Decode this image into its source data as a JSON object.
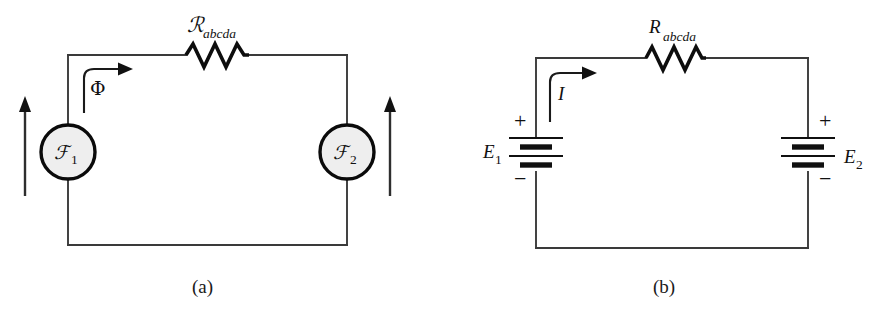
{
  "figure": {
    "background_color": "#ffffff",
    "ink_color": "#111111",
    "source_fill_color": "#eeeeee"
  },
  "panel_a": {
    "caption": "(a)",
    "resistor_label": {
      "symbol": "ℛ",
      "subscript": "abcda",
      "full": "ℛabcda",
      "name": "reluctance"
    },
    "flux_label": {
      "symbol": "Φ",
      "name": "magnetic-flux"
    },
    "source_left": {
      "symbol": "ℱ",
      "subscript": "1",
      "full": "ℱ1",
      "name": "magnetomotive-force-1"
    },
    "source_right": {
      "symbol": "ℱ",
      "subscript": "2",
      "full": "ℱ2",
      "name": "magnetomotive-force-2"
    },
    "arrow_left": "up",
    "arrow_right": "up"
  },
  "panel_b": {
    "caption": "(b)",
    "resistor_label": {
      "symbol": "R",
      "subscript": "abcda",
      "full": "Rabcda",
      "name": "resistance"
    },
    "current_label": {
      "symbol": "I",
      "name": "current"
    },
    "battery_left": {
      "symbol": "E",
      "subscript": "1",
      "full": "E1",
      "plus": "+",
      "minus": "−",
      "plus_position": "top-left",
      "minus_position": "bottom-left",
      "cells": 2
    },
    "battery_right": {
      "symbol": "E",
      "subscript": "2",
      "full": "E2",
      "plus": "+",
      "minus": "−",
      "plus_position": "top-right",
      "minus_position": "bottom-right",
      "cells": 2
    }
  }
}
